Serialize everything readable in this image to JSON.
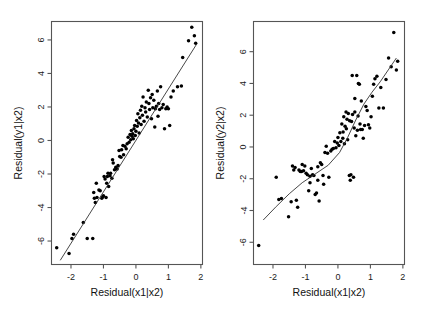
{
  "figure": {
    "background": "#ffffff",
    "point_color": "#000000",
    "axis_color": "#555555",
    "line_color": "#333333",
    "width": 426,
    "height": 319
  },
  "chart_data": [
    {
      "type": "scatter",
      "title": "",
      "xlabel": "Residual(x1|x2)",
      "ylabel": "Residual(y1|x2)",
      "xlim": [
        -2.6,
        2.05
      ],
      "ylim": [
        -7.4,
        7.1
      ],
      "xticks": [
        -2,
        -1,
        0,
        1,
        2
      ],
      "xticklabels": [
        "-2",
        "-1",
        "0",
        "1",
        "2"
      ],
      "yticks": [
        -6,
        -4,
        -2,
        0,
        2,
        4,
        6
      ],
      "yticklabels": [
        "-6",
        "-4",
        "-2",
        "0",
        "2",
        "4",
        "6"
      ],
      "grid": false,
      "legend": "none",
      "fit": {
        "type": "linear",
        "x": [
          -2.33,
          1.87
        ],
        "y": [
          -7.15,
          5.75
        ]
      },
      "x": [
        -2.44,
        -2.06,
        -1.97,
        -1.92,
        -1.62,
        -1.5,
        -1.33,
        -1.3,
        -1.28,
        -1.25,
        -1.22,
        -1.2,
        -1.14,
        -1.1,
        -1.05,
        -1.02,
        -1.0,
        -0.98,
        -0.95,
        -0.92,
        -0.9,
        -0.88,
        -0.86,
        -0.84,
        -0.8,
        -0.78,
        -0.74,
        -0.72,
        -0.7,
        -0.66,
        -0.62,
        -0.58,
        -0.55,
        -0.52,
        -0.5,
        -0.46,
        -0.44,
        -0.4,
        -0.38,
        -0.34,
        -0.3,
        -0.27,
        -0.24,
        -0.21,
        -0.18,
        -0.16,
        -0.14,
        -0.12,
        -0.1,
        -0.08,
        -0.06,
        -0.04,
        -0.02,
        0.0,
        0.02,
        0.04,
        0.06,
        0.08,
        0.1,
        0.12,
        0.14,
        0.16,
        0.18,
        0.2,
        0.22,
        0.25,
        0.28,
        0.3,
        0.32,
        0.35,
        0.38,
        0.4,
        0.42,
        0.45,
        0.48,
        0.5,
        0.52,
        0.55,
        0.58,
        0.6,
        0.63,
        0.66,
        0.68,
        0.7,
        0.73,
        0.76,
        0.8,
        0.84,
        0.88,
        0.92,
        0.96,
        1.0,
        1.04,
        1.08,
        1.15,
        1.28,
        1.4,
        1.44,
        1.62,
        1.72,
        1.8,
        1.84
      ],
      "y": [
        -6.4,
        -6.75,
        -5.85,
        -5.6,
        -4.9,
        -5.85,
        -5.85,
        -3.1,
        -3.45,
        -3.7,
        -2.55,
        -3.4,
        -2.95,
        -3.0,
        -3.45,
        -3.35,
        -3.3,
        -2.15,
        -2.3,
        -3.4,
        -2.55,
        -2.15,
        -1.95,
        -2.75,
        -2.1,
        -1.95,
        -2.25,
        -1.15,
        -1.35,
        -1.75,
        -1.6,
        -1.7,
        -1.5,
        -0.6,
        -0.95,
        -1.0,
        -0.55,
        -0.3,
        -0.85,
        -0.35,
        -0.5,
        -0.2,
        0.2,
        -0.1,
        0.35,
        0.05,
        0.6,
        0.25,
        0.4,
        0.1,
        0.7,
        0.9,
        0.3,
        0.55,
        1.2,
        0.85,
        1.6,
        1.05,
        0.45,
        1.35,
        1.8,
        0.95,
        2.05,
        1.5,
        2.6,
        1.15,
        1.95,
        1.7,
        2.3,
        1.4,
        3.0,
        2.2,
        1.85,
        2.55,
        1.3,
        2.75,
        1.95,
        2.4,
        0.8,
        1.9,
        2.05,
        2.95,
        1.45,
        2.2,
        1.85,
        3.2,
        1.95,
        2.15,
        0.7,
        1.9,
        2.0,
        1.9,
        0.9,
        2.6,
        2.95,
        3.2,
        3.25,
        4.95,
        5.95,
        6.75,
        6.25,
        5.8
      ]
    },
    {
      "type": "scatter",
      "title": "",
      "xlabel": "Residual(x1|x2)",
      "ylabel": "Residual(y2|x2)",
      "xlim": [
        -2.6,
        2.05
      ],
      "ylim": [
        -7.4,
        7.9
      ],
      "xticks": [
        -2,
        -1,
        0,
        1,
        2
      ],
      "xticklabels": [
        "-2",
        "-1",
        "0",
        "1",
        "2"
      ],
      "yticks": [
        -6,
        -4,
        -2,
        0,
        2,
        4,
        6
      ],
      "yticklabels": [
        "-6",
        "-4",
        "-2",
        "0",
        "2",
        "4",
        "6"
      ],
      "grid": false,
      "legend": "none",
      "fit": {
        "type": "smooth",
        "x": [
          -2.3,
          -1.9,
          -1.5,
          -1.1,
          -0.7,
          -0.3,
          0.05,
          0.3,
          0.55,
          0.8,
          1.05,
          1.3,
          1.55,
          1.8
        ],
        "y": [
          -4.6,
          -3.75,
          -2.95,
          -2.25,
          -1.7,
          -1.15,
          -0.35,
          0.6,
          1.7,
          2.7,
          3.45,
          4.1,
          4.85,
          5.6
        ]
      },
      "x": [
        -2.44,
        -1.9,
        -1.82,
        -1.74,
        -1.52,
        -1.44,
        -1.4,
        -1.36,
        -1.32,
        -1.28,
        -1.24,
        -1.2,
        -1.16,
        -1.12,
        -1.06,
        -1.02,
        -0.98,
        -0.94,
        -0.9,
        -0.86,
        -0.82,
        -0.78,
        -0.74,
        -0.7,
        -0.66,
        -0.62,
        -0.58,
        -0.54,
        -0.5,
        -0.44,
        -0.4,
        -0.36,
        -0.32,
        -0.28,
        -0.22,
        -0.18,
        -0.14,
        -0.1,
        -0.06,
        -0.02,
        0.0,
        0.03,
        0.06,
        0.09,
        0.12,
        0.15,
        0.18,
        0.2,
        0.22,
        0.25,
        0.28,
        0.3,
        0.32,
        0.35,
        0.38,
        0.4,
        0.42,
        0.45,
        0.48,
        0.5,
        0.52,
        0.55,
        0.58,
        0.6,
        0.63,
        0.66,
        0.68,
        0.72,
        0.75,
        0.78,
        0.82,
        0.86,
        0.9,
        0.94,
        0.98,
        1.02,
        1.06,
        1.1,
        1.14,
        1.2,
        1.26,
        1.32,
        1.4,
        1.48,
        1.56,
        1.64,
        1.72,
        1.8,
        1.84,
        0.36,
        0.44,
        0.52,
        0.62,
        0.7,
        0.26,
        0.16,
        -0.46,
        -0.62,
        -0.86,
        -1.1
      ],
      "y": [
        -6.2,
        -1.9,
        -3.3,
        -3.25,
        -4.4,
        -3.45,
        -1.2,
        -1.45,
        -1.3,
        -3.35,
        -3.8,
        -1.45,
        -1.55,
        -1.55,
        -1.5,
        -1.2,
        -1.65,
        -1.75,
        -2.75,
        -1.85,
        -1.35,
        -1.75,
        -1.8,
        -3.0,
        -2.9,
        -1.25,
        -3.4,
        -1.0,
        -1.1,
        -2.35,
        -0.35,
        0.05,
        -0.4,
        -1.9,
        -0.25,
        -0.15,
        -0.1,
        0.35,
        -0.05,
        0.25,
        0.6,
        0.1,
        0.9,
        0.35,
        1.45,
        0.55,
        1.9,
        0.2,
        1.3,
        2.2,
        1.75,
        0.45,
        2.1,
        -1.8,
        -2.1,
        -1.75,
        1.6,
        2.05,
        -1.9,
        1.2,
        3.05,
        0.7,
        4.5,
        1.05,
        4.0,
        3.95,
        1.45,
        2.9,
        1.1,
        0.55,
        1.35,
        2.55,
        2.3,
        1.4,
        1.2,
        1.9,
        3.2,
        3.95,
        4.3,
        4.45,
        2.45,
        3.75,
        2.45,
        4.25,
        5.6,
        5.05,
        7.2,
        4.85,
        5.4,
        1.65,
        4.5,
        2.2,
        1.95,
        1.1,
        1.15,
        0.95,
        -1.8,
        -2.1,
        -2.25,
        -1.1
      ]
    }
  ]
}
